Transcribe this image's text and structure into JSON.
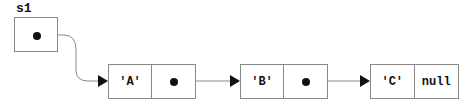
{
  "variable": {
    "name": "s1"
  },
  "nodes": [
    {
      "value": "'A'",
      "next": "pointer"
    },
    {
      "value": "'B'",
      "next": "pointer"
    },
    {
      "value": "'C'",
      "next": "null"
    }
  ],
  "colors": {
    "stroke": "#888888",
    "ink": "#111111"
  }
}
